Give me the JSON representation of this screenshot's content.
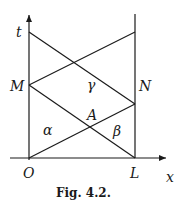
{
  "figure": {
    "caption": "Fig. 4.2.",
    "axes": {
      "vertical_label": "t",
      "horizontal_label": "x"
    },
    "points": {
      "origin": "O",
      "right_base": "L",
      "left_mid": "M",
      "right_mid": "N",
      "intersection": "A"
    },
    "regions": {
      "left": "α",
      "right": "β",
      "top": "γ"
    }
  }
}
